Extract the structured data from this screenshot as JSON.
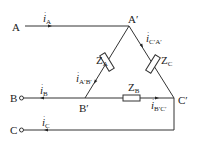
{
  "diagram": {
    "type": "three-phase delta-connected load circuit",
    "terminals": [
      {
        "id": "A",
        "label": "A"
      },
      {
        "id": "B",
        "label": "B"
      },
      {
        "id": "C",
        "label": "C"
      }
    ],
    "nodes": [
      {
        "id": "A'",
        "label": "A",
        "prime": "′"
      },
      {
        "id": "B'",
        "label": "B",
        "prime": "′"
      },
      {
        "id": "C'",
        "label": "C",
        "prime": "′"
      }
    ],
    "impedances": [
      {
        "id": "ZA",
        "main": "Z",
        "sub": "A"
      },
      {
        "id": "ZB",
        "main": "Z",
        "sub": "B"
      },
      {
        "id": "ZC",
        "main": "Z",
        "sub": "C"
      }
    ],
    "line_currents": [
      {
        "id": "iA",
        "main": "i",
        "dot": "·",
        "sub": "A"
      },
      {
        "id": "iB",
        "main": "i",
        "dot": "·",
        "sub": "B"
      },
      {
        "id": "iC",
        "main": "i",
        "dot": "·",
        "sub": "C"
      }
    ],
    "phase_currents": [
      {
        "id": "iA'B'",
        "main": "i",
        "dot": "·",
        "sub": "A′B′"
      },
      {
        "id": "iB'C'",
        "main": "i",
        "dot": "·",
        "sub": "B′C′"
      },
      {
        "id": "iC'A'",
        "main": "i",
        "dot": "·",
        "sub": "C′A′"
      }
    ],
    "line_color": "#333333"
  }
}
